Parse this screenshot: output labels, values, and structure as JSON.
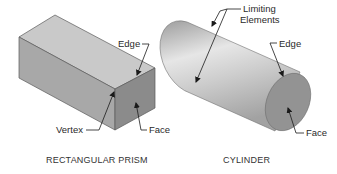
{
  "figures": [
    {
      "id": "prism",
      "caption": "RECTANGULAR PRISM",
      "labels": {
        "edge": "Edge",
        "vertex": "Vertex",
        "face": "Face"
      },
      "colors": {
        "top_face": "#c9c9c9",
        "front_face": "#a9a9a9",
        "end_face": "#8c8c8c",
        "outline": "#555555"
      }
    },
    {
      "id": "cylinder",
      "caption": "CYLINDER",
      "labels": {
        "limiting_line1": "Limiting",
        "limiting_line2": "Elements",
        "edge": "Edge",
        "face": "Face"
      },
      "colors": {
        "body_light": "#e4e4e4",
        "body_dark": "#9a9a9a",
        "end_face": "#939393",
        "outline": "#6a6a6a"
      }
    }
  ],
  "leader_color": "#1a1a1a"
}
